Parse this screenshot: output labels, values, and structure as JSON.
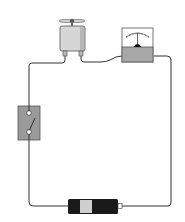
{
  "diagram": {
    "type": "series-circuit",
    "width": 185,
    "height": 222,
    "colors": {
      "background": "#ffffff",
      "wire": "#333333",
      "component_gray": "#9a9a9a",
      "component_light": "#d9d9d9",
      "meter_face": "#ffffff",
      "meter_base": "#a8a8a8",
      "battery_body": "#1a1a1a",
      "battery_band": "#cfcfcf"
    },
    "components": [
      {
        "id": "motor",
        "label": "motor with propeller"
      },
      {
        "id": "meter",
        "label": "ammeter"
      },
      {
        "id": "switch",
        "label": "switch",
        "state": "open"
      },
      {
        "id": "battery",
        "label": "battery"
      }
    ]
  }
}
